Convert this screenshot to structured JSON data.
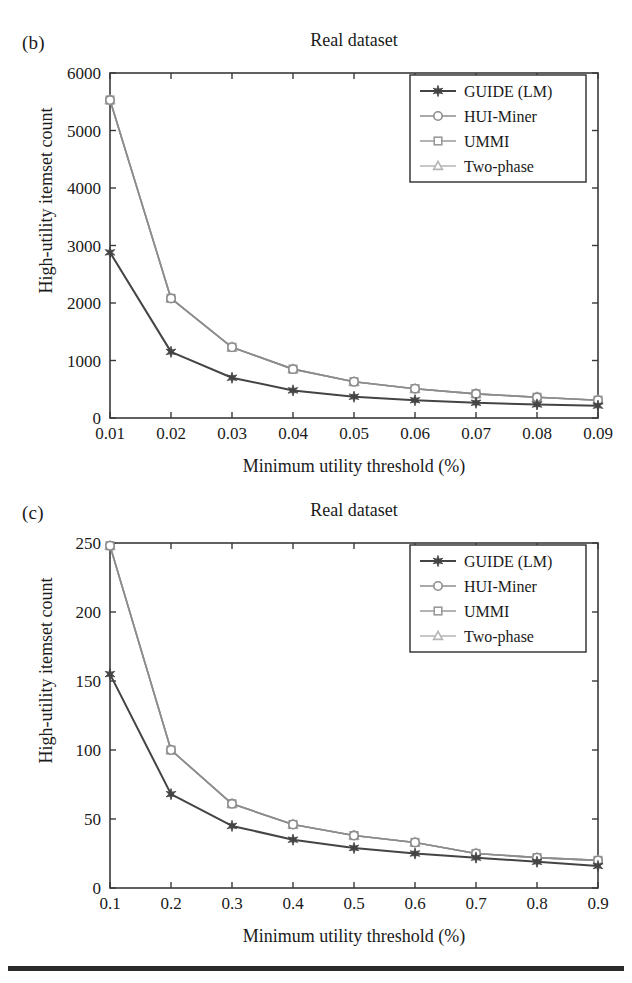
{
  "figure": {
    "bottom_rule": "horizontal-rule"
  },
  "panels": [
    {
      "tag": "(b)",
      "title": "Real dataset",
      "xlabel": "Minimum utility threshold (%)",
      "ylabel": "High-utility itemset count"
    },
    {
      "tag": "(c)",
      "title": "Real dataset",
      "xlabel": "Minimum utility threshold (%)",
      "ylabel": "High-utility itemset count"
    }
  ],
  "colors": {
    "guide": "#444444",
    "hui_miner": "#8c8c8c",
    "ummi": "#9a9a9a",
    "two_phase": "#b5b5b5",
    "axis": "#3a3a3a",
    "text": "#1a1a1a",
    "rule": "#2b2b2b"
  },
  "chart_data": [
    {
      "type": "line",
      "title": "Real dataset",
      "panel": "(b)",
      "xlabel": "Minimum utility threshold (%)",
      "ylabel": "High-utility itemset count",
      "x": [
        0.01,
        0.02,
        0.03,
        0.04,
        0.05,
        0.06,
        0.07,
        0.08,
        0.09
      ],
      "xtick_labels": [
        "0.01",
        "0.02",
        "0.03",
        "0.04",
        "0.05",
        "0.06",
        "0.07",
        "0.08",
        "0.09"
      ],
      "ytick_labels": [
        "0",
        "1000",
        "2000",
        "3000",
        "4000",
        "5000",
        "6000"
      ],
      "ylim": [
        0,
        6000
      ],
      "xlim": [
        0.01,
        0.09
      ],
      "grid": false,
      "legend_position": "top-right",
      "series": [
        {
          "name": "GUIDE (LM)",
          "marker": "star",
          "color": "#444444",
          "values": [
            2880,
            1150,
            700,
            480,
            370,
            310,
            265,
            235,
            215
          ]
        },
        {
          "name": "HUI-Miner",
          "marker": "circle",
          "color": "#8c8c8c",
          "values": [
            5530,
            2080,
            1230,
            850,
            630,
            510,
            420,
            360,
            310
          ]
        },
        {
          "name": "UMMI",
          "marker": "square",
          "color": "#9a9a9a",
          "values": [
            5530,
            2080,
            1230,
            850,
            630,
            510,
            420,
            360,
            310
          ]
        },
        {
          "name": "Two-phase",
          "marker": "triangle",
          "color": "#b5b5b5",
          "values": [
            5530,
            2080,
            1230,
            850,
            630,
            510,
            420,
            360,
            310
          ]
        }
      ]
    },
    {
      "type": "line",
      "title": "Real dataset",
      "panel": "(c)",
      "xlabel": "Minimum utility threshold (%)",
      "ylabel": "High-utility itemset count",
      "x": [
        0.1,
        0.2,
        0.3,
        0.4,
        0.5,
        0.6,
        0.7,
        0.8,
        0.9
      ],
      "xtick_labels": [
        "0.1",
        "0.2",
        "0.3",
        "0.4",
        "0.5",
        "0.6",
        "0.7",
        "0.8",
        "0.9"
      ],
      "ytick_labels": [
        "0",
        "50",
        "100",
        "150",
        "200",
        "250"
      ],
      "ylim": [
        0,
        250
      ],
      "xlim": [
        0.1,
        0.9
      ],
      "grid": false,
      "legend_position": "top-right",
      "series": [
        {
          "name": "GUIDE (LM)",
          "marker": "star",
          "color": "#444444",
          "values": [
            155,
            68,
            45,
            35,
            29,
            25,
            22,
            19,
            16
          ]
        },
        {
          "name": "HUI-Miner",
          "marker": "circle",
          "color": "#8c8c8c",
          "values": [
            248,
            100,
            61,
            46,
            38,
            33,
            25,
            22,
            20
          ]
        },
        {
          "name": "UMMI",
          "marker": "square",
          "color": "#9a9a9a",
          "values": [
            248,
            100,
            61,
            46,
            38,
            33,
            25,
            22,
            20
          ]
        },
        {
          "name": "Two-phase",
          "marker": "triangle",
          "color": "#b5b5b5",
          "values": [
            248,
            100,
            61,
            46,
            38,
            33,
            25,
            22,
            20
          ]
        }
      ]
    }
  ]
}
